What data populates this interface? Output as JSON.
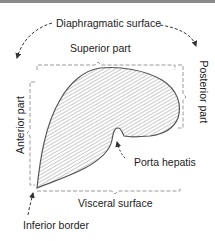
{
  "diagram": {
    "labels": {
      "diaphragmatic_surface": "Diaphragmatic surface",
      "superior_part": "Superior part",
      "anterior_part": "Anterior part",
      "posterior_part": "Posterior part",
      "porta_hepatis": "Porta hepatis",
      "visceral_surface": "Visceral surface",
      "inferior_border": "Inferior border"
    },
    "colors": {
      "outline": "#555555",
      "hatch": "#7a7a7a",
      "bracket": "#9a9a9a",
      "arrow": "#333333",
      "text": "#222222"
    }
  }
}
